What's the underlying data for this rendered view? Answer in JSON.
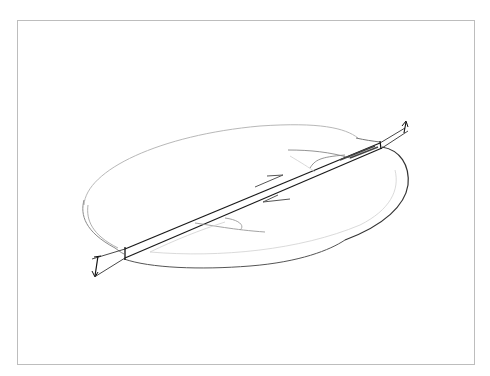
{
  "diagram": {
    "colors": {
      "background": "#ffffff",
      "frame": "#bdbdbd",
      "faint_pencil": "#b8b8b8",
      "medium_pencil": "#707070",
      "dark_pencil": "#1a1a1a"
    },
    "elements": [
      "frame",
      "elliptical-body-outline",
      "fault-plane",
      "slip-arrow-upper-right",
      "slip-arrow-lower-left",
      "offset-marker-left",
      "offset-marker-right",
      "drag-fold-lines"
    ]
  }
}
